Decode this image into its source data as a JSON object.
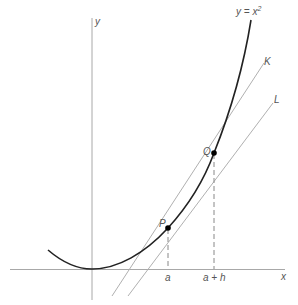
{
  "diagram": {
    "curve_label": "y = x",
    "curve_exponent": "2",
    "y_axis_label": "y",
    "x_axis_label": "x",
    "point_p_label": "P",
    "point_q_label": "Q",
    "line_k_label": "K",
    "line_l_label": "L",
    "tick_a_label": "a",
    "tick_a_plus_h_label": "a + h",
    "colors": {
      "curve": "#222222",
      "axes": "#999999",
      "lines": "#aaaaaa",
      "dashed": "#888888",
      "points": "#000000"
    }
  }
}
